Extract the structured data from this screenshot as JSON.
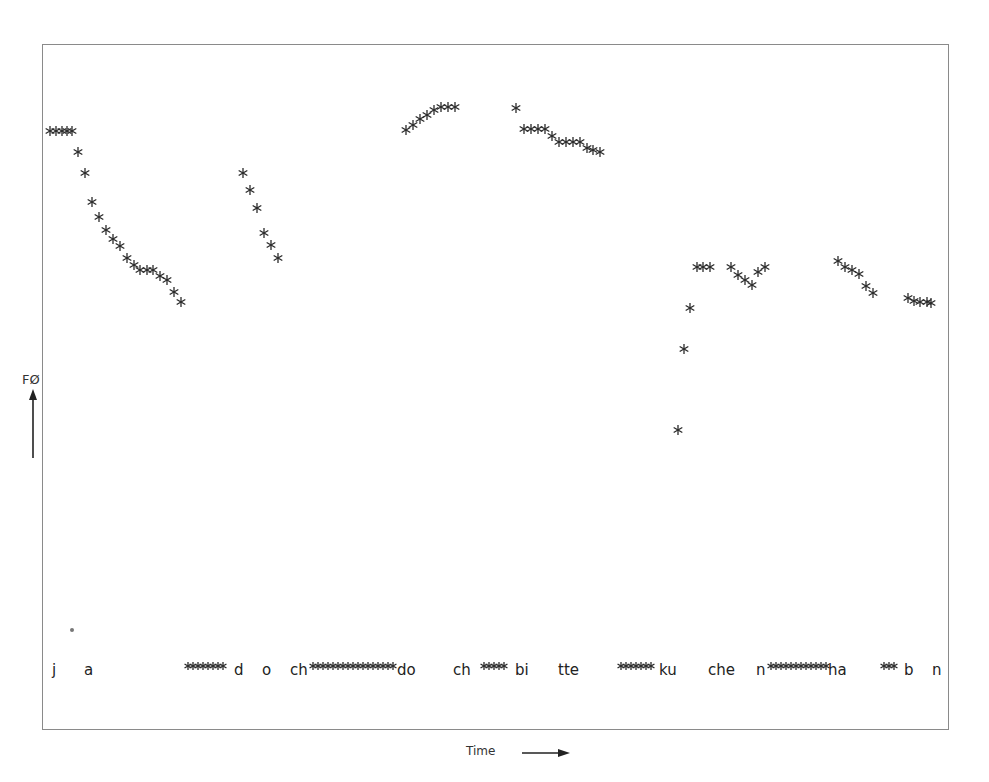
{
  "chart_data": {
    "type": "scatter",
    "title": "",
    "xlabel": "Time",
    "ylabel": "F0",
    "ylabel_display": "FØ",
    "grid": false,
    "legend": null,
    "marker": "asterisk",
    "marker_color": "#2a2a2a",
    "frame": {
      "left": 42,
      "top": 44,
      "right": 950,
      "bottom": 730
    },
    "note": "Pixel coordinates of F0 contour points (x = time position, y = screen y; smaller y = higher F0)",
    "series": [
      {
        "name": "ja",
        "points": [
          [
            50,
            131
          ],
          [
            56,
            131
          ],
          [
            62,
            131
          ],
          [
            67,
            131
          ],
          [
            72,
            131
          ],
          [
            78,
            152
          ],
          [
            85,
            173
          ],
          [
            92,
            202
          ],
          [
            99,
            217
          ],
          [
            106,
            230
          ],
          [
            113,
            239
          ],
          [
            120,
            246
          ],
          [
            127,
            258
          ],
          [
            134,
            265
          ],
          [
            140,
            270
          ],
          [
            147,
            270
          ],
          [
            153,
            270
          ],
          [
            160,
            276
          ],
          [
            167,
            280
          ],
          [
            174,
            292
          ],
          [
            181,
            302
          ]
        ]
      },
      {
        "name": "doch",
        "points": [
          [
            243,
            173
          ],
          [
            250,
            190
          ],
          [
            257,
            208
          ],
          [
            264,
            233
          ],
          [
            271,
            245
          ],
          [
            278,
            258
          ]
        ]
      },
      {
        "name": "doch2",
        "points": [
          [
            406,
            130
          ],
          [
            413,
            125
          ],
          [
            420,
            119
          ],
          [
            427,
            115
          ],
          [
            434,
            110
          ],
          [
            441,
            107
          ],
          [
            448,
            107
          ],
          [
            455,
            107
          ]
        ]
      },
      {
        "name": "bitte",
        "points": [
          [
            516,
            108
          ],
          [
            524,
            129
          ],
          [
            531,
            129
          ],
          [
            538,
            129
          ],
          [
            545,
            129
          ],
          [
            552,
            136
          ],
          [
            559,
            142
          ],
          [
            566,
            142
          ],
          [
            573,
            142
          ],
          [
            580,
            142
          ],
          [
            587,
            148
          ],
          [
            593,
            150
          ],
          [
            600,
            152
          ]
        ]
      },
      {
        "name": "kuchen",
        "points": [
          [
            678,
            430
          ],
          [
            684,
            349
          ],
          [
            690,
            308
          ],
          [
            697,
            267
          ],
          [
            703,
            267
          ],
          [
            710,
            267
          ],
          [
            731,
            267
          ],
          [
            738,
            275
          ],
          [
            745,
            280
          ],
          [
            752,
            285
          ],
          [
            758,
            272
          ],
          [
            765,
            267
          ]
        ]
      },
      {
        "name": "haben",
        "points": [
          [
            838,
            261
          ],
          [
            845,
            267
          ],
          [
            852,
            270
          ],
          [
            859,
            274
          ],
          [
            866,
            286
          ],
          [
            873,
            293
          ],
          [
            908,
            298
          ],
          [
            914,
            301
          ],
          [
            920,
            302
          ],
          [
            927,
            302
          ],
          [
            931,
            303
          ]
        ]
      }
    ],
    "annotations": [
      {
        "text": "j",
        "x": 52,
        "y": 675
      },
      {
        "text": "a",
        "x": 84,
        "y": 675
      },
      {
        "text": "d",
        "x": 234,
        "y": 675
      },
      {
        "text": "o",
        "x": 262,
        "y": 675
      },
      {
        "text": "ch",
        "x": 290,
        "y": 675
      },
      {
        "text": "do",
        "x": 397,
        "y": 675
      },
      {
        "text": "ch",
        "x": 453,
        "y": 675
      },
      {
        "text": "bi",
        "x": 515,
        "y": 675
      },
      {
        "text": "tte",
        "x": 558,
        "y": 675
      },
      {
        "text": "ku",
        "x": 659,
        "y": 675
      },
      {
        "text": "che",
        "x": 708,
        "y": 675
      },
      {
        "text": "n",
        "x": 756,
        "y": 675
      },
      {
        "text": "ha",
        "x": 828,
        "y": 675
      },
      {
        "text": "b",
        "x": 904,
        "y": 675
      },
      {
        "text": "n",
        "x": 932,
        "y": 675
      }
    ],
    "baseline_marker_runs": [
      {
        "x1": 188,
        "x2": 227,
        "y": 666
      },
      {
        "x1": 313,
        "x2": 395,
        "y": 666
      },
      {
        "x1": 484,
        "x2": 508,
        "y": 666
      },
      {
        "x1": 621,
        "x2": 654,
        "y": 666
      },
      {
        "x1": 771,
        "x2": 826,
        "y": 666
      },
      {
        "x1": 884,
        "x2": 898,
        "y": 666
      }
    ],
    "stray_mark": {
      "x": 72,
      "y": 630
    }
  },
  "axes": {
    "y_label": "FØ",
    "x_label": "Time"
  }
}
